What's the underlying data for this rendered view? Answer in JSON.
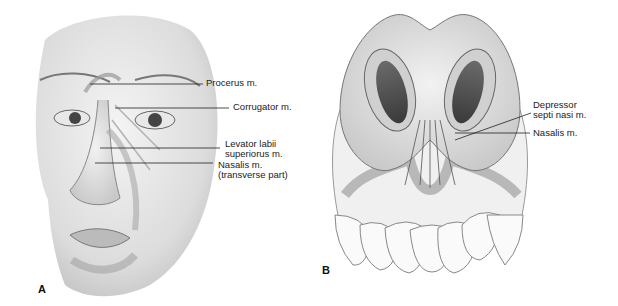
{
  "figure": {
    "panels": [
      {
        "letter": "A",
        "subject": "face-frontal-oblique-view",
        "labels": [
          {
            "text": "Procerus m."
          },
          {
            "text": "Corrugator m."
          },
          {
            "text": "Levator labii\nsuperiorus m."
          },
          {
            "text": "Nasalis m.\n(transverse part)"
          }
        ]
      },
      {
        "letter": "B",
        "subject": "nose-base-inferior-view",
        "labels": [
          {
            "text": "Depressor\nsepti nasi m."
          },
          {
            "text": "Nasalis m."
          }
        ]
      }
    ]
  }
}
